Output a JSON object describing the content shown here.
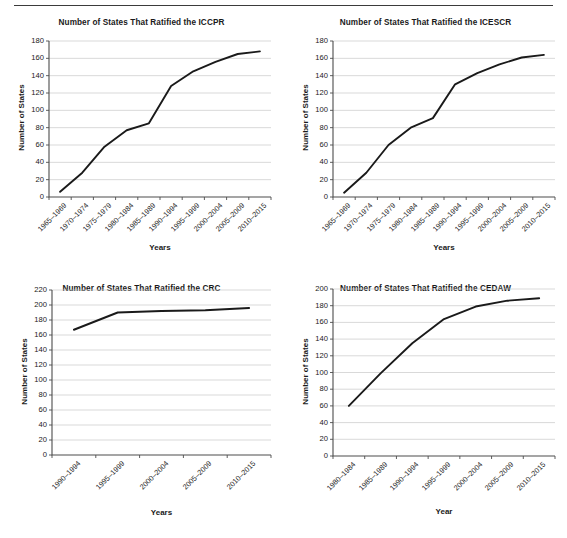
{
  "page": {
    "background_color": "#ffffff",
    "line_color": "#1a1a1a",
    "grid_color": "#c8c8c8",
    "axis_color": "#4d4d4d",
    "divider": "top-horizontal-rule"
  },
  "charts": [
    {
      "id": "iccpr",
      "chart_data": {
        "type": "line",
        "title": "Number of States That Ratified the ICCPR",
        "xlabel": "Years",
        "ylabel": "Number of States",
        "categories": [
          "1965–1969",
          "1970–1974",
          "1975–1979",
          "1980–1984",
          "1985–1989",
          "1990–1994",
          "1995–1999",
          "2000–2004",
          "2005–2009",
          "2010–2015"
        ],
        "values": [
          6,
          28,
          58,
          77,
          85,
          128,
          145,
          156,
          165,
          168
        ],
        "ylim": [
          0,
          180
        ],
        "ytick_step": 20,
        "yticks": [
          0,
          20,
          40,
          60,
          80,
          100,
          120,
          140,
          160,
          180
        ],
        "grid": "horizontal",
        "legend": "none"
      }
    },
    {
      "id": "icescr",
      "chart_data": {
        "type": "line",
        "title": "Number of States That Ratified the ICESCR",
        "xlabel": "Years",
        "ylabel": "Number of States",
        "categories": [
          "1965–1969",
          "1970–1974",
          "1975–1979",
          "1980–1984",
          "1985–1989",
          "1990–1994",
          "1995–1999",
          "2000–2004",
          "2005–2009",
          "2010–2015"
        ],
        "values": [
          5,
          28,
          60,
          80,
          91,
          130,
          143,
          153,
          161,
          164
        ],
        "ylim": [
          0,
          180
        ],
        "ytick_step": 20,
        "yticks": [
          0,
          20,
          40,
          60,
          80,
          100,
          120,
          140,
          160,
          180
        ],
        "grid": "horizontal",
        "legend": "none"
      }
    },
    {
      "id": "crc",
      "chart_data": {
        "type": "line",
        "title": "Number of States That Ratified the CRC",
        "xlabel": "Years",
        "ylabel": "Number of States",
        "categories": [
          "1990–1994",
          "1995–1999",
          "2000–2004",
          "2005–2009",
          "2010–2015"
        ],
        "values": [
          167,
          190,
          192,
          193,
          196
        ],
        "ylim": [
          0,
          220
        ],
        "ytick_step": 20,
        "yticks": [
          0,
          20,
          40,
          60,
          80,
          100,
          120,
          140,
          160,
          180,
          200,
          220
        ],
        "grid": "horizontal",
        "legend": "none"
      }
    },
    {
      "id": "cedaw",
      "chart_data": {
        "type": "line",
        "title": "Number of States That Ratified the CEDAW",
        "xlabel": "Year",
        "ylabel": "Number of States",
        "categories": [
          "1980–1984",
          "1985–1989",
          "1990–1994",
          "1995–1999",
          "2000–2004",
          "2005–2009",
          "2010–2015"
        ],
        "values": [
          60,
          99,
          135,
          164,
          179,
          186,
          189
        ],
        "ylim": [
          0,
          200
        ],
        "ytick_step": 20,
        "yticks": [
          0,
          20,
          40,
          60,
          80,
          100,
          120,
          140,
          160,
          180,
          200
        ],
        "grid": "horizontal",
        "legend": "none"
      }
    }
  ]
}
